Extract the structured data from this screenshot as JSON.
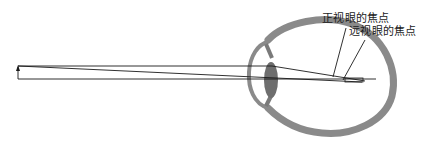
{
  "diagram": {
    "labels": {
      "normal_eye_focus": "正视眼的焦点",
      "hyperopic_eye_focus": "远视眼的焦点"
    },
    "colors": {
      "tissue": "#8a8a8a",
      "lens": "#6e6e6e",
      "ray": "#1a1a1a",
      "background": "#ffffff"
    },
    "elements": [
      "object-arrow",
      "parallel-ray-top",
      "optical-axis-ray",
      "chief-ray",
      "eyeball-sclera",
      "cornea",
      "crystalline-lens",
      "normal-focus-leader",
      "hyperopic-focus-leader"
    ]
  }
}
